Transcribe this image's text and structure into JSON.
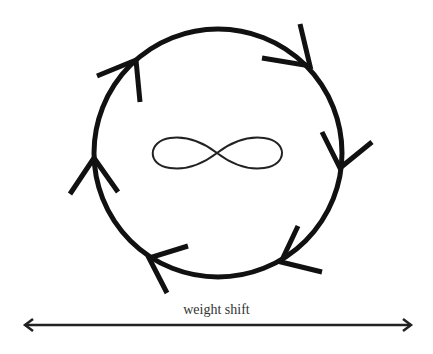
{
  "diagram": {
    "title": "",
    "colors": {
      "stroke": "#111111",
      "text": "#333333",
      "background": "#ffffff"
    },
    "cycle": {
      "shape": "circle",
      "direction": "clockwise",
      "center": [
        218,
        153
      ],
      "radius": 124,
      "arrowheads": [
        {
          "name": "top-left",
          "tip": [
            136,
            60
          ],
          "wing1": [
            97,
            76
          ],
          "wing2": [
            140,
            102
          ]
        },
        {
          "name": "top-right",
          "tip": [
            310,
            66
          ],
          "wing1": [
            300,
            24
          ],
          "wing2": [
            262,
            58
          ]
        },
        {
          "name": "right",
          "tip": [
            340,
            168
          ],
          "wing1": [
            322,
            132
          ],
          "wing2": [
            372,
            142
          ]
        },
        {
          "name": "bottom-right",
          "tip": [
            281,
            262
          ],
          "wing1": [
            298,
            226
          ],
          "wing2": [
            322,
            272
          ]
        },
        {
          "name": "bottom-left",
          "tip": [
            149,
            258
          ],
          "wing1": [
            188,
            246
          ],
          "wing2": [
            167,
            293
          ]
        },
        {
          "name": "left",
          "tip": [
            94,
            158
          ],
          "wing1": [
            70,
            194
          ],
          "wing2": [
            118,
            192
          ]
        }
      ]
    },
    "center_symbol": {
      "name": "infinity",
      "glyph": "∞"
    },
    "axis": {
      "label": "weight shift",
      "type": "double-headed-arrow",
      "x1": 24,
      "x2": 412,
      "y": 325
    }
  }
}
